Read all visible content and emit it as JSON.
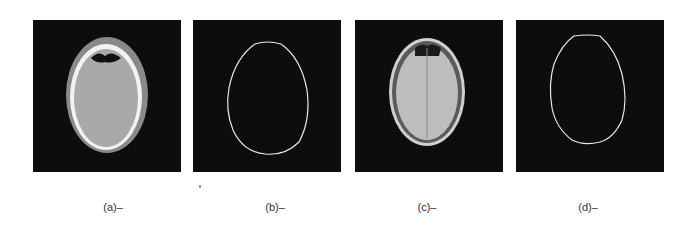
{
  "figure": {
    "panels": [
      {
        "id": "a",
        "label": "(a)–",
        "kind": "ct-head-slice"
      },
      {
        "id": "b",
        "label": "(b)–",
        "kind": "skull-contour"
      },
      {
        "id": "c",
        "label": "(c)–",
        "kind": "mr-head-slice"
      },
      {
        "id": "d",
        "label": "(d)–",
        "kind": "skull-contour"
      }
    ]
  }
}
